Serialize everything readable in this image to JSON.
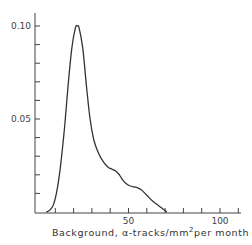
{
  "chart_data": {
    "type": "line",
    "title": "",
    "xlabel": "Background,  α-tracks/mm² per month",
    "xlabel_parts": {
      "main": "Background,  α-tracks/mm",
      "sup": "2",
      "tail": "per month"
    },
    "ylabel": "",
    "xlim": [
      0,
      115
    ],
    "ylim": [
      0,
      0.11
    ],
    "x_ticks": [
      0,
      10,
      20,
      30,
      40,
      50,
      60,
      70,
      80,
      90,
      100,
      110
    ],
    "x_tick_labels": [
      {
        "value": 50,
        "label": "50"
      },
      {
        "value": 100,
        "label": "100"
      }
    ],
    "y_ticks": [
      0,
      0.01,
      0.02,
      0.03,
      0.04,
      0.05,
      0.06,
      0.07,
      0.08,
      0.09,
      0.1
    ],
    "y_tick_labels": [
      {
        "value": 0.05,
        "label": "0.05"
      },
      {
        "value": 0.1,
        "label": "0.10"
      }
    ],
    "grid": false,
    "legend": null,
    "series": [
      {
        "name": "background distribution",
        "x": [
          5,
          7,
          9,
          11,
          13,
          15,
          17,
          19,
          21,
          22,
          23,
          25,
          27,
          29,
          31,
          33,
          35,
          37,
          39,
          41,
          43,
          45,
          47,
          49,
          51,
          53,
          55,
          57,
          59,
          61,
          63,
          65,
          67,
          69,
          71
        ],
        "y": [
          0.0,
          0.001,
          0.004,
          0.012,
          0.026,
          0.045,
          0.068,
          0.088,
          0.099,
          0.1,
          0.099,
          0.088,
          0.068,
          0.05,
          0.039,
          0.033,
          0.029,
          0.026,
          0.024,
          0.023,
          0.022,
          0.02,
          0.017,
          0.015,
          0.014,
          0.0135,
          0.013,
          0.012,
          0.01,
          0.008,
          0.006,
          0.0045,
          0.003,
          0.0015,
          0.0
        ]
      }
    ]
  }
}
